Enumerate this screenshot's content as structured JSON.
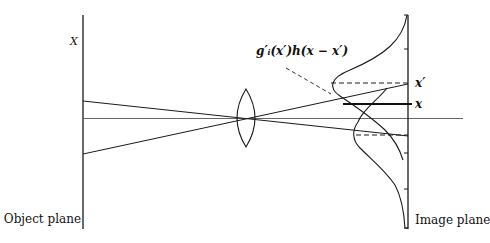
{
  "diagram": {
    "type": "optics-imaging",
    "labels": {
      "object_axis": "X",
      "object_plane": "Object plane",
      "image_plane": "Image plane",
      "formula": "g′ᵢ(x′)h(x − x′)",
      "x_prime": "x′",
      "x": "x"
    },
    "elements": [
      {
        "name": "object-plane",
        "kind": "vertical-line"
      },
      {
        "name": "image-plane",
        "kind": "vertical-line",
        "ticks": 4
      },
      {
        "name": "optical-axis",
        "kind": "horizontal-line"
      },
      {
        "name": "lens",
        "kind": "biconvex-lens"
      },
      {
        "name": "ray-upper",
        "kind": "ray"
      },
      {
        "name": "ray-lower",
        "kind": "ray"
      },
      {
        "name": "psf-upper",
        "kind": "gaussian-curve",
        "peak_label": "x′"
      },
      {
        "name": "psf-lower",
        "kind": "gaussian-curve"
      },
      {
        "name": "observation-line",
        "kind": "thick-line",
        "label": "x"
      }
    ],
    "colors": {
      "stroke": "#1a1a1a",
      "axis": "#555555",
      "background": "#ffffff"
    }
  }
}
